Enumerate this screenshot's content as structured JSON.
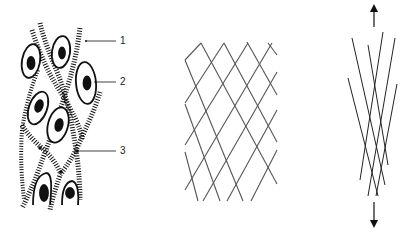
{
  "figure": {
    "panels": [
      {
        "id": "cells-with-fibers",
        "description": "Cells embedded among hatched collagen-like fibers",
        "labels": [
          {
            "text": "1",
            "target": "fiber",
            "x": 120,
            "y": 41
          },
          {
            "text": "2",
            "target": "cell-nucleus",
            "x": 120,
            "y": 82
          },
          {
            "text": "3",
            "target": "fiber-crossing",
            "x": 120,
            "y": 151
          }
        ]
      },
      {
        "id": "relaxed-lattice",
        "description": "Diamond lattice of crossing fibers (relaxed state)"
      },
      {
        "id": "stretched-lattice",
        "description": "Lattice elongated under tension",
        "arrows": [
          "up",
          "down"
        ]
      }
    ],
    "colors": {
      "ink": "#111111",
      "lattice": "#555555",
      "background": "#ffffff"
    }
  }
}
